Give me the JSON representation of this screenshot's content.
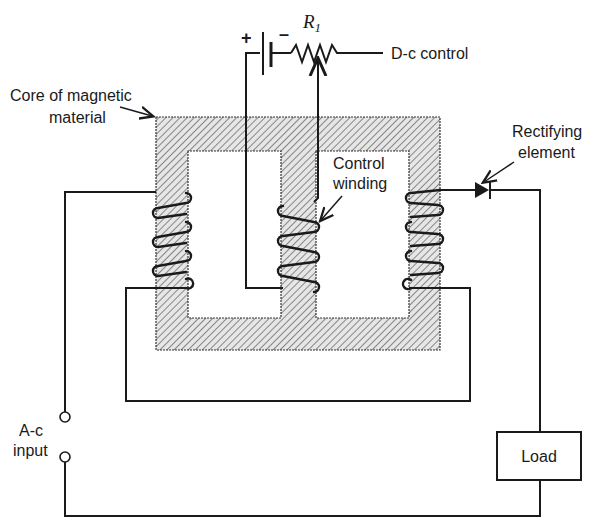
{
  "diagram": {
    "type": "magnetic-amplifier circuit schematic",
    "labels": {
      "core": [
        "Core of magnetic",
        "material"
      ],
      "dc_control": "D-c control",
      "resistor": "R",
      "resistor_subscript": "1",
      "battery_plus": "+",
      "battery_minus": "–",
      "control_winding": [
        "Control",
        "winding"
      ],
      "rectifier": [
        "Rectifying",
        "element"
      ],
      "ac_input": [
        "A-c",
        "input"
      ],
      "load": "Load"
    },
    "colors": {
      "ink": "#1a1a1a",
      "core_fill": "#d9d9d9",
      "hatch": "#6e6e6e",
      "background": "#ffffff"
    },
    "components": [
      {
        "name": "magnetic-core",
        "kind": "three-leg core with two windows"
      },
      {
        "name": "left-ac-winding",
        "turns": 4
      },
      {
        "name": "control-winding",
        "turns": 3,
        "leg": "center"
      },
      {
        "name": "right-ac-winding",
        "turns": 4
      },
      {
        "name": "battery",
        "polarity": "+ left, - right"
      },
      {
        "name": "potentiometer",
        "label": "R1"
      },
      {
        "name": "rectifying-element",
        "kind": "diode"
      },
      {
        "name": "load",
        "kind": "box"
      },
      {
        "name": "ac-input-terminals",
        "count": 2
      }
    ]
  }
}
